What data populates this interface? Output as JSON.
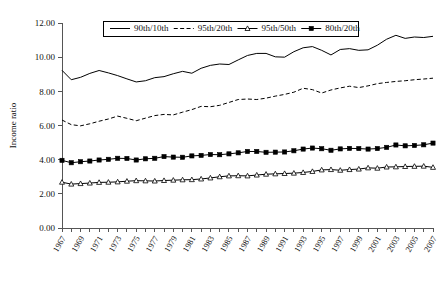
{
  "chart_data": {
    "type": "line",
    "title": "",
    "xlabel": "",
    "ylabel": "Income ratio",
    "ylim": [
      0,
      12
    ],
    "ytick_step": 2,
    "yticks": [
      "0.00",
      "2.00",
      "4.00",
      "6.00",
      "8.00",
      "10.00",
      "12.00"
    ],
    "grid": false,
    "legend_position": "top-center",
    "x": [
      1967,
      1968,
      1969,
      1970,
      1971,
      1972,
      1973,
      1974,
      1975,
      1976,
      1977,
      1978,
      1979,
      1980,
      1981,
      1982,
      1983,
      1984,
      1985,
      1986,
      1987,
      1988,
      1989,
      1990,
      1991,
      1992,
      1993,
      1994,
      1995,
      1996,
      1997,
      1998,
      1999,
      2000,
      2001,
      2002,
      2003,
      2004,
      2005,
      2006,
      2007
    ],
    "xtick_labels": [
      "1967",
      "1969",
      "1971",
      "1973",
      "1975",
      "1977",
      "1979",
      "1981",
      "1983",
      "1985",
      "1987",
      "1989",
      "1991",
      "1993",
      "1995",
      "1997",
      "1999",
      "2001",
      "2003",
      "2005",
      "2007"
    ],
    "xlim": [
      1967,
      2007
    ],
    "series": [
      {
        "name": "90th/10th",
        "style": "solid",
        "marker": "none",
        "color": "#000000",
        "values": [
          9.23,
          8.68,
          8.82,
          9.05,
          9.22,
          9.08,
          8.92,
          8.73,
          8.55,
          8.62,
          8.8,
          8.86,
          9.03,
          9.17,
          9.06,
          9.35,
          9.52,
          9.6,
          9.57,
          9.84,
          10.1,
          10.22,
          10.22,
          10.02,
          10.0,
          10.32,
          10.55,
          10.62,
          10.4,
          10.13,
          10.45,
          10.5,
          10.4,
          10.43,
          10.7,
          11.05,
          11.28,
          11.1,
          11.18,
          11.15,
          11.22
        ]
      },
      {
        "name": "95th/20th",
        "style": "dashed",
        "marker": "none",
        "color": "#000000",
        "values": [
          6.32,
          6.05,
          5.98,
          6.1,
          6.25,
          6.38,
          6.55,
          6.42,
          6.28,
          6.43,
          6.58,
          6.65,
          6.62,
          6.78,
          6.93,
          7.12,
          7.1,
          7.18,
          7.35,
          7.52,
          7.55,
          7.52,
          7.6,
          7.72,
          7.82,
          7.95,
          8.18,
          8.1,
          7.9,
          8.08,
          8.2,
          8.3,
          8.22,
          8.32,
          8.45,
          8.52,
          8.58,
          8.62,
          8.68,
          8.72,
          8.77
        ]
      },
      {
        "name": "95th/50th",
        "style": "solid",
        "marker": "triangle",
        "color": "#000000",
        "values": [
          2.68,
          2.57,
          2.6,
          2.63,
          2.67,
          2.68,
          2.7,
          2.74,
          2.77,
          2.76,
          2.75,
          2.78,
          2.8,
          2.82,
          2.83,
          2.87,
          2.93,
          3.0,
          3.05,
          3.06,
          3.05,
          3.1,
          3.15,
          3.17,
          3.19,
          3.21,
          3.25,
          3.31,
          3.4,
          3.42,
          3.38,
          3.42,
          3.45,
          3.52,
          3.5,
          3.57,
          3.58,
          3.6,
          3.61,
          3.62,
          3.55
        ]
      },
      {
        "name": "80th/20th",
        "style": "solid",
        "marker": "square",
        "color": "#000000",
        "values": [
          3.96,
          3.82,
          3.88,
          3.92,
          3.98,
          4.02,
          4.08,
          4.07,
          3.98,
          4.05,
          4.08,
          4.18,
          4.15,
          4.14,
          4.22,
          4.25,
          4.3,
          4.29,
          4.34,
          4.4,
          4.48,
          4.48,
          4.43,
          4.44,
          4.45,
          4.52,
          4.62,
          4.68,
          4.64,
          4.55,
          4.63,
          4.66,
          4.65,
          4.62,
          4.65,
          4.72,
          4.86,
          4.81,
          4.83,
          4.87,
          4.97
        ]
      }
    ]
  }
}
